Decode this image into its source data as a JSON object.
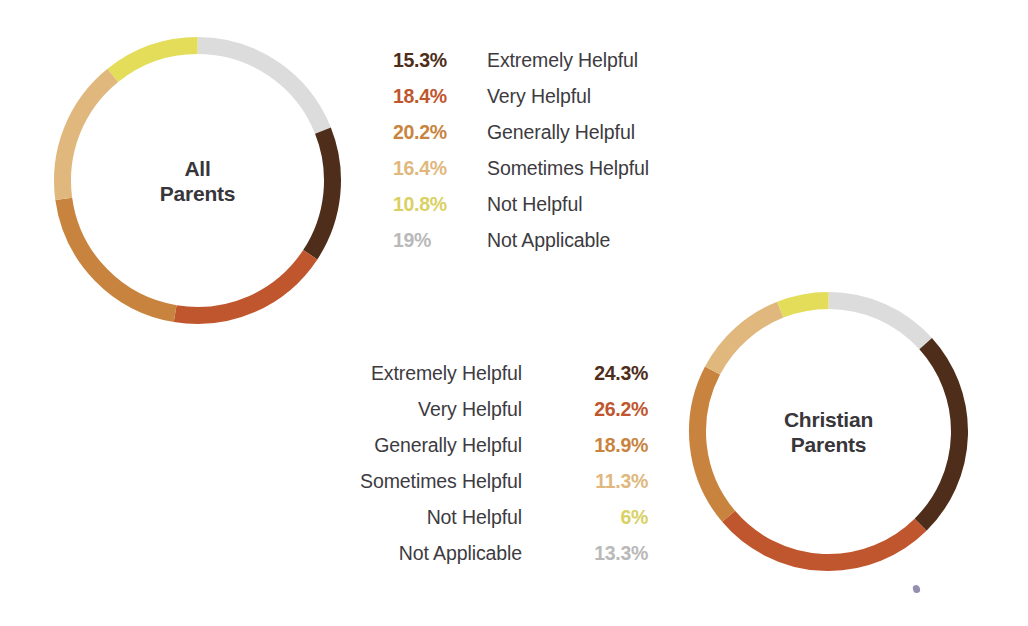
{
  "page": {
    "background_color": "#ffffff",
    "text_color": "#3d3b3f"
  },
  "palette": {
    "extremely_helpful": "#4e2e1a",
    "very_helpful": "#c0562e",
    "generally_helpful": "#c8843e",
    "sometimes_helpful": "#e0b87e",
    "not_helpful": "#e3dd5a",
    "not_applicable": "#dcdcdc"
  },
  "charts": {
    "all_parents": {
      "center_title_line1": "All",
      "center_title_line2": "Parents"
    },
    "christian_parents": {
      "center_title_line1": "Christian",
      "center_title_line2": "Parents"
    }
  },
  "legends": {
    "all_parents": [
      {
        "value": "15.3%",
        "label": "Extremely Helpful",
        "color": "#4e2e1a"
      },
      {
        "value": "18.4%",
        "label": "Very Helpful",
        "color": "#c0562e"
      },
      {
        "value": "20.2%",
        "label": "Generally Helpful",
        "color": "#c8843e"
      },
      {
        "value": "16.4%",
        "label": "Sometimes Helpful",
        "color": "#e0b87e"
      },
      {
        "value": "10.8%",
        "label": "Not Helpful",
        "color": "#d9d162"
      },
      {
        "value": "19%",
        "label": "Not Applicable",
        "color": "#b9b9b9"
      }
    ],
    "christian_parents": [
      {
        "label": "Extremely Helpful",
        "value": "24.3%",
        "color": "#4e2e1a"
      },
      {
        "label": "Very Helpful",
        "value": "26.2%",
        "color": "#c0562e"
      },
      {
        "label": "Generally Helpful",
        "value": "18.9%",
        "color": "#c8843e"
      },
      {
        "label": "Sometimes Helpful",
        "value": "11.3%",
        "color": "#e0b87e"
      },
      {
        "label": "Not Helpful",
        "value": "6%",
        "color": "#d9d162"
      },
      {
        "label": "Not Applicable",
        "value": "13.3%",
        "color": "#b9b9b9"
      }
    ]
  },
  "chart_data": [
    {
      "type": "pie",
      "variant": "donut",
      "title": "All Parents",
      "xlabel": "",
      "ylabel": "",
      "units": "percent",
      "start_angle_deg": 0,
      "direction": "clockwise",
      "legend_position": "right",
      "grid": false,
      "slice_order_from_twelve_oclock": [
        "Not Applicable",
        "Extremely Helpful",
        "Very Helpful",
        "Generally Helpful",
        "Sometimes Helpful",
        "Not Helpful"
      ],
      "categories": [
        "Extremely Helpful",
        "Very Helpful",
        "Generally Helpful",
        "Sometimes Helpful",
        "Not Helpful",
        "Not Applicable"
      ],
      "values": [
        15.3,
        18.4,
        20.2,
        16.4,
        10.8,
        19
      ],
      "colors": [
        "#4e2e1a",
        "#c0562e",
        "#c8843e",
        "#e0b87e",
        "#e3dd5a",
        "#dcdcdc"
      ],
      "total": 100.1
    },
    {
      "type": "pie",
      "variant": "donut",
      "title": "Christian Parents",
      "xlabel": "",
      "ylabel": "",
      "units": "percent",
      "start_angle_deg": 0,
      "direction": "clockwise",
      "legend_position": "left",
      "grid": false,
      "slice_order_from_twelve_oclock": [
        "Not Applicable",
        "Extremely Helpful",
        "Very Helpful",
        "Generally Helpful",
        "Sometimes Helpful",
        "Not Helpful"
      ],
      "categories": [
        "Extremely Helpful",
        "Very Helpful",
        "Generally Helpful",
        "Sometimes Helpful",
        "Not Helpful",
        "Not Applicable"
      ],
      "values": [
        24.3,
        26.2,
        18.9,
        11.3,
        6,
        13.3
      ],
      "colors": [
        "#4e2e1a",
        "#c0562e",
        "#c8843e",
        "#e0b87e",
        "#e3dd5a",
        "#dcdcdc"
      ],
      "total": 100.0
    }
  ]
}
